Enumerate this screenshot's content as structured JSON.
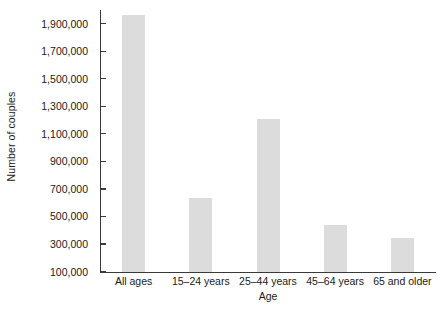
{
  "chart_data": {
    "type": "bar",
    "title": "",
    "subtitle": "",
    "xlabel": "Age",
    "ylabel": "Number of couples",
    "categories": [
      "All ages",
      "15–24 years",
      "25–44 years",
      "45–64 years",
      "65 and older"
    ],
    "values": [
      1970000,
      635000,
      1210000,
      440000,
      350000
    ],
    "series": [
      {
        "name": "Number of couples",
        "values": [
          1970000,
          635000,
          1210000,
          440000,
          350000
        ]
      }
    ],
    "ylim": [
      100000,
      2000000
    ],
    "ytick_values": [
      100000,
      300000,
      500000,
      700000,
      900000,
      1100000,
      1300000,
      1500000,
      1700000,
      1900000
    ],
    "ytick_labels": [
      "100,000",
      "300,000",
      "500,000",
      "700,000",
      "900,000",
      "1,100,000",
      "1,300,000",
      "1,500,000",
      "1,700,000",
      "1,900,000"
    ],
    "grid": false,
    "legend": false,
    "legend_position": "none",
    "bar_color": "#dcdcdc",
    "axis_color": "#3a3a3a",
    "background_color": "#ffffff",
    "annotations": []
  }
}
